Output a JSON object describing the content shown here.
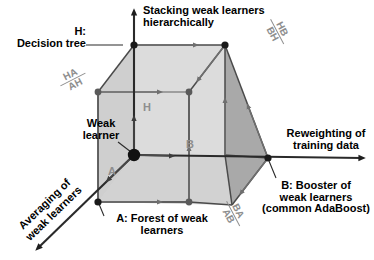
{
  "figure": {
    "type": "diagram",
    "background_color": "#ffffff",
    "line_color": "#4a4a4a",
    "vertex_color": "#1a1a1a",
    "edge_label_color": "#8e8e8e",
    "face_shades": {
      "front": "#d6d6d6",
      "top": "#c2c2c2",
      "right": "#a8a8a8",
      "back_plane": "#cfcfcf"
    }
  },
  "axes": [
    {
      "id": "axis-h",
      "letter": "H",
      "direction": "up",
      "caption_line1": "Stacking weak learners",
      "caption_line2": "hierarchically"
    },
    {
      "id": "axis-b",
      "letter": "B",
      "direction": "right",
      "caption_line1": "Reweighting of",
      "caption_line2": "training data"
    },
    {
      "id": "axis-a",
      "letter": "A",
      "direction": "down-left",
      "caption_line1": "Averaging of",
      "caption_line2": "weak learners"
    }
  ],
  "vertices": [
    {
      "id": "origin",
      "label_line1": "Weak",
      "label_line2": "learner",
      "kind": "origin"
    },
    {
      "id": "vertex-h",
      "label_line1": "H:",
      "label_line2": "Decision tree",
      "kind": "named"
    },
    {
      "id": "vertex-a",
      "label_line1": "A: Forest of weak",
      "label_line2": "learners",
      "kind": "named"
    },
    {
      "id": "vertex-b",
      "label_line1": "B: Booster of",
      "label_line2": "weak learners",
      "label_line3": "(common AdaBoost)",
      "kind": "named"
    }
  ],
  "composite_labels": [
    {
      "id": "ha-ah",
      "numerator": "HA",
      "denominator": "AH",
      "rotation_deg": -27
    },
    {
      "id": "hb-bh",
      "numerator": "HB",
      "denominator": "BH",
      "rotation_deg": 62
    },
    {
      "id": "ba-ab",
      "numerator": "BA",
      "denominator": "AB",
      "rotation_deg": 62
    }
  ],
  "edge_letters": [
    {
      "id": "edge-letter-h",
      "text": "H"
    },
    {
      "id": "edge-letter-b",
      "text": "B"
    },
    {
      "id": "edge-letter-a",
      "text": "A"
    }
  ]
}
